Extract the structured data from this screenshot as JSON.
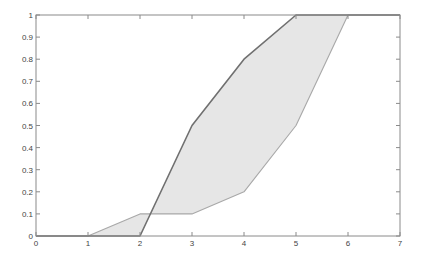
{
  "chart_data": {
    "type": "area",
    "title": "",
    "xlabel": "",
    "ylabel": "",
    "xlim": [
      0,
      7
    ],
    "ylim": [
      0,
      1
    ],
    "grid": false,
    "legend": null,
    "x_ticks": [
      "0",
      "1",
      "2",
      "3",
      "4",
      "5",
      "6",
      "7"
    ],
    "y_ticks": [
      "0",
      "0.1",
      "0.2",
      "0.3",
      "0.4",
      "0.5",
      "0.6",
      "0.7",
      "0.8",
      "0.9",
      "1"
    ],
    "series": [
      {
        "name": "upper",
        "color": "#707070",
        "points": [
          [
            0,
            0
          ],
          [
            2,
            0
          ],
          [
            3,
            0.5
          ],
          [
            4,
            0.8
          ],
          [
            5,
            1
          ],
          [
            7,
            1
          ]
        ]
      },
      {
        "name": "lower",
        "color": "#a8a8a8",
        "points": [
          [
            0,
            0
          ],
          [
            1,
            0
          ],
          [
            2,
            0.1
          ],
          [
            3,
            0.1
          ],
          [
            4,
            0.2
          ],
          [
            5,
            0.5
          ],
          [
            6,
            1
          ],
          [
            7,
            1
          ]
        ]
      }
    ],
    "fill_between": {
      "color": "#e6e6e6",
      "between": [
        "upper",
        "lower"
      ]
    }
  }
}
